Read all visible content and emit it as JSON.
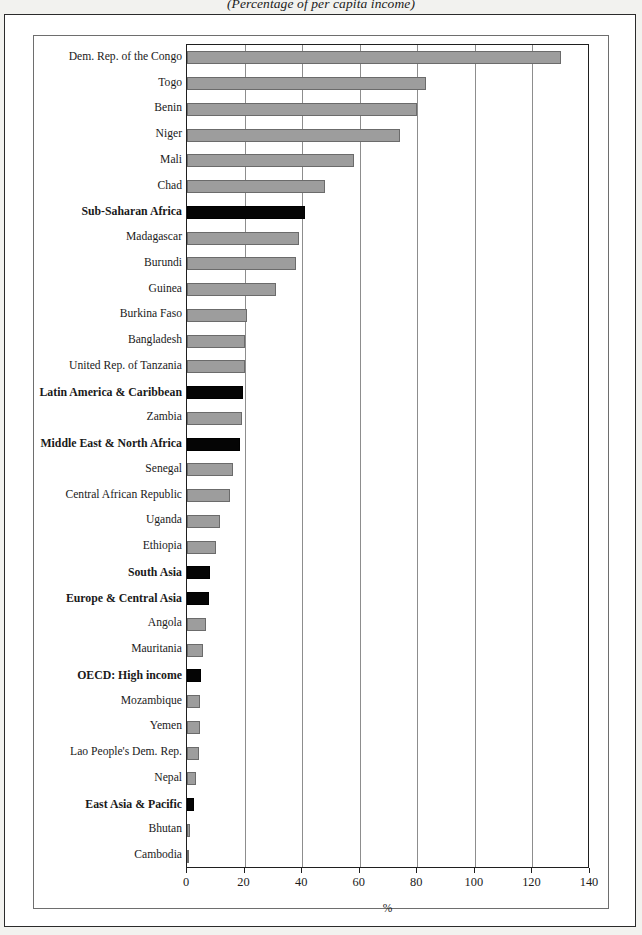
{
  "subtitle": "(Percentage of per capita income)",
  "chart_data": {
    "type": "bar",
    "orientation": "horizontal",
    "title": "",
    "subtitle": "(Percentage of per capita income)",
    "xlabel": "%",
    "ylabel": "",
    "xlim": [
      0,
      140
    ],
    "xticks": [
      0,
      20,
      40,
      60,
      80,
      100,
      120,
      140
    ],
    "xtick_labels": [
      "0",
      "20",
      "40",
      "60",
      "80",
      "100",
      "120",
      "140"
    ],
    "grid": true,
    "legend": false,
    "categories": [
      "Dem. Rep. of the Congo",
      "Togo",
      "Benin",
      "Niger",
      "Mali",
      "Chad",
      "Sub-Saharan Africa",
      "Madagascar",
      "Burundi",
      "Guinea",
      "Burkina Faso",
      "Bangladesh",
      "United Rep. of Tanzania",
      "Latin America & Caribbean",
      "Zambia",
      "Middle East & North Africa",
      "Senegal",
      "Central African Republic",
      "Uganda",
      "Ethiopia",
      "South Asia",
      "Europe & Central Asia",
      "Angola",
      "Mauritania",
      "OECD: High income",
      "Mozambique",
      "Yemen",
      "Lao People's Dem. Rep.",
      "Nepal",
      "East Asia & Pacific",
      "Bhutan",
      "Cambodia"
    ],
    "values": [
      130,
      83,
      80,
      74,
      58,
      48,
      41,
      39,
      38,
      31,
      21,
      20,
      20,
      19.5,
      19,
      18.5,
      16,
      15,
      11.5,
      10,
      8,
      7.5,
      6.5,
      5.5,
      5,
      4.5,
      4.5,
      4,
      3,
      2.5,
      1,
      0.3
    ],
    "series_kinds": [
      "country",
      "country",
      "country",
      "country",
      "country",
      "country",
      "aggregate",
      "country",
      "country",
      "country",
      "country",
      "country",
      "country",
      "aggregate",
      "country",
      "aggregate",
      "country",
      "country",
      "country",
      "country",
      "aggregate",
      "aggregate",
      "country",
      "country",
      "aggregate",
      "country",
      "country",
      "country",
      "country",
      "aggregate",
      "country",
      "country"
    ],
    "colors": {
      "country_bar": "#9d9d9d",
      "aggregate_bar": "#050505",
      "gridline": "#8d8d8d",
      "axis": "#1f1f1f",
      "text": "#1a1a1a"
    }
  }
}
